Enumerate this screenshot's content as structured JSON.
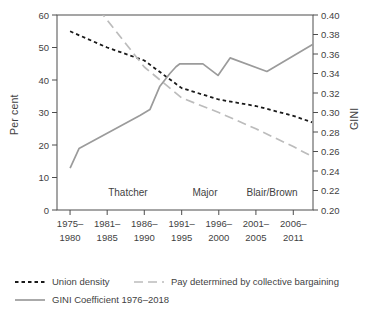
{
  "figure": {
    "background": "#ffffff",
    "axis_color": "#4d4d4d",
    "text_color": "#3f3f3f"
  },
  "chart_data": {
    "type": "line",
    "title": "",
    "left_axis": {
      "label": "Per cent",
      "min": 0,
      "max": 60,
      "tick_labels": [
        "0",
        "10",
        "20",
        "30",
        "40",
        "50",
        "60"
      ]
    },
    "right_axis": {
      "label": "GINI",
      "min": 0.2,
      "max": 0.4,
      "tick_labels": [
        "0.20",
        "0.22",
        "0.24",
        "0.26",
        "0.28",
        "0.30",
        "0.32",
        "0.34",
        "0.36",
        "0.38",
        "0.40"
      ]
    },
    "categories": [
      "1975–1980",
      "1981–1985",
      "1986–1990",
      "1991–1995",
      "1996–2000",
      "2001–2005",
      "2006–2011"
    ],
    "category_label_lines": [
      [
        "1975–",
        "1980"
      ],
      [
        "1981–",
        "1985"
      ],
      [
        "1986–",
        "1990"
      ],
      [
        "1991–",
        "1995"
      ],
      [
        "1996–",
        "2000"
      ],
      [
        "2001–",
        "2005"
      ],
      [
        "2006–",
        "2011"
      ]
    ],
    "category_x_frac": [
      0.051,
      0.196,
      0.341,
      0.487,
      0.632,
      0.777,
      0.923
    ],
    "era_annotations": [
      {
        "label": "Thatcher",
        "x_frac": 0.277
      },
      {
        "label": "Major",
        "x_frac": 0.578
      },
      {
        "label": "Blair/Brown",
        "x_frac": 0.84
      }
    ],
    "series": [
      {
        "name": "Union density",
        "axis": "left",
        "color": "#1a1a1a",
        "dash": "3.5,3",
        "width": 1.8,
        "values_by_period": [
          55,
          50,
          46,
          37.5,
          34,
          32,
          29
        ],
        "points": [
          {
            "x": 0.051,
            "v": 55
          },
          {
            "x": 0.196,
            "v": 50
          },
          {
            "x": 0.341,
            "v": 46
          },
          {
            "x": 0.487,
            "v": 37.5
          },
          {
            "x": 0.632,
            "v": 34
          },
          {
            "x": 0.777,
            "v": 32
          },
          {
            "x": 0.923,
            "v": 29
          },
          {
            "x": 0.996,
            "v": 27
          }
        ]
      },
      {
        "name": "Pay determined by collective bargaining",
        "axis": "left",
        "color": "#bcbcbc",
        "dash": "9,5",
        "width": 1.7,
        "values_by_period": [
          null,
          60,
          44,
          34.5,
          30,
          25,
          19.5
        ],
        "note": "1975–1980 value lies above the 60% axis maximum; line enters plot clipped at top edge",
        "points": [
          {
            "x": 0.13,
            "v": 65
          },
          {
            "x": 0.18,
            "v": 60
          },
          {
            "x": 0.341,
            "v": 44
          },
          {
            "x": 0.487,
            "v": 34.5
          },
          {
            "x": 0.632,
            "v": 30
          },
          {
            "x": 0.777,
            "v": 25
          },
          {
            "x": 0.923,
            "v": 19.5
          },
          {
            "x": 0.996,
            "v": 16.5
          }
        ]
      },
      {
        "name": "GINI Coefficient 1976–2018",
        "axis": "right",
        "color": "#9b9b9b",
        "dash": "",
        "width": 1.7,
        "values_by_period": [
          0.243,
          0.278,
          0.298,
          0.35,
          0.338,
          0.346,
          0.354
        ],
        "points": [
          {
            "x": 0.051,
            "v": 0.243
          },
          {
            "x": 0.086,
            "v": 0.263
          },
          {
            "x": 0.324,
            "v": 0.297
          },
          {
            "x": 0.363,
            "v": 0.303
          },
          {
            "x": 0.402,
            "v": 0.327
          },
          {
            "x": 0.441,
            "v": 0.34
          },
          {
            "x": 0.465,
            "v": 0.347
          },
          {
            "x": 0.48,
            "v": 0.35
          },
          {
            "x": 0.57,
            "v": 0.35
          },
          {
            "x": 0.629,
            "v": 0.338
          },
          {
            "x": 0.676,
            "v": 0.356
          },
          {
            "x": 0.82,
            "v": 0.342
          },
          {
            "x": 1.0,
            "v": 0.37
          }
        ]
      }
    ],
    "legend_rows": [
      [
        0,
        1
      ],
      [
        2
      ]
    ],
    "legend_position": "bottom-left",
    "grid": false
  }
}
